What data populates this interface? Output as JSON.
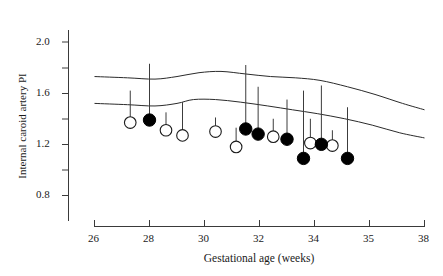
{
  "chart_data": {
    "type": "scatter",
    "title": "",
    "xlabel": "Gestational age (weeks)",
    "ylabel": "Internal caroid artery PI",
    "xlim": [
      26,
      38
    ],
    "ylim": [
      0.6,
      2.1
    ],
    "grid": false,
    "legend": "none",
    "x_ticks": [
      26,
      28,
      30,
      32,
      34,
      35,
      38
    ],
    "x_tick_labels": [
      "26",
      "28",
      "30",
      "32",
      "34",
      "35",
      "38"
    ],
    "y_ticks": [
      0.8,
      1.0,
      1.2,
      1.4,
      1.6,
      1.8,
      2.0
    ],
    "y_tick_labels": [
      "0.8",
      "",
      "1.2",
      "",
      "1.6",
      "",
      "2.0"
    ],
    "y_major_labels": [
      "2.0",
      "1.6",
      "1.2",
      "0.8"
    ],
    "series": [
      {
        "name": "open circles",
        "marker": "open-circle",
        "points": [
          {
            "x": 27.3,
            "y": 1.37,
            "error_top": 1.62
          },
          {
            "x": 28.6,
            "y": 1.31,
            "error_top": 1.45
          },
          {
            "x": 29.2,
            "y": 1.27,
            "error_top": 1.53
          },
          {
            "x": 30.4,
            "y": 1.3,
            "error_top": 1.41
          },
          {
            "x": 31.15,
            "y": 1.18,
            "error_top": 1.33
          },
          {
            "x": 32.5,
            "y": 1.26,
            "error_top": 1.4
          },
          {
            "x": 33.85,
            "y": 1.21,
            "error_top": 1.4
          },
          {
            "x": 34.65,
            "y": 1.19,
            "error_top": 1.31
          }
        ]
      },
      {
        "name": "filled circles",
        "marker": "filled-circle",
        "points": [
          {
            "x": 28.0,
            "y": 1.39,
            "error_top": 1.83
          },
          {
            "x": 31.5,
            "y": 1.32,
            "error_top": 1.82
          },
          {
            "x": 31.95,
            "y": 1.28,
            "error_top": 1.65
          },
          {
            "x": 33.0,
            "y": 1.24,
            "error_top": 1.55
          },
          {
            "x": 33.6,
            "y": 1.09,
            "error_top": 1.62
          },
          {
            "x": 34.25,
            "y": 1.2,
            "error_top": 1.66
          },
          {
            "x": 35.2,
            "y": 1.09,
            "error_top": 1.49
          }
        ]
      }
    ],
    "reference_curves": [
      {
        "name": "upper reference limit",
        "points": [
          {
            "x": 26.0,
            "y": 1.73
          },
          {
            "x": 27.2,
            "y": 1.72
          },
          {
            "x": 28.2,
            "y": 1.71
          },
          {
            "x": 29.0,
            "y": 1.73
          },
          {
            "x": 29.8,
            "y": 1.76
          },
          {
            "x": 30.6,
            "y": 1.77
          },
          {
            "x": 31.5,
            "y": 1.75
          },
          {
            "x": 32.4,
            "y": 1.73
          },
          {
            "x": 33.3,
            "y": 1.72
          },
          {
            "x": 34.2,
            "y": 1.7
          },
          {
            "x": 35.2,
            "y": 1.65
          },
          {
            "x": 36.2,
            "y": 1.59
          },
          {
            "x": 37.2,
            "y": 1.52
          },
          {
            "x": 38.0,
            "y": 1.47
          }
        ]
      },
      {
        "name": "lower reference limit",
        "points": [
          {
            "x": 26.0,
            "y": 1.52
          },
          {
            "x": 27.2,
            "y": 1.51
          },
          {
            "x": 28.2,
            "y": 1.5
          },
          {
            "x": 29.0,
            "y": 1.52
          },
          {
            "x": 29.6,
            "y": 1.55
          },
          {
            "x": 30.4,
            "y": 1.55
          },
          {
            "x": 31.3,
            "y": 1.53
          },
          {
            "x": 32.3,
            "y": 1.5
          },
          {
            "x": 33.2,
            "y": 1.47
          },
          {
            "x": 34.1,
            "y": 1.44
          },
          {
            "x": 35.1,
            "y": 1.4
          },
          {
            "x": 36.1,
            "y": 1.35
          },
          {
            "x": 37.1,
            "y": 1.29
          },
          {
            "x": 38.0,
            "y": 1.25
          }
        ]
      }
    ]
  }
}
